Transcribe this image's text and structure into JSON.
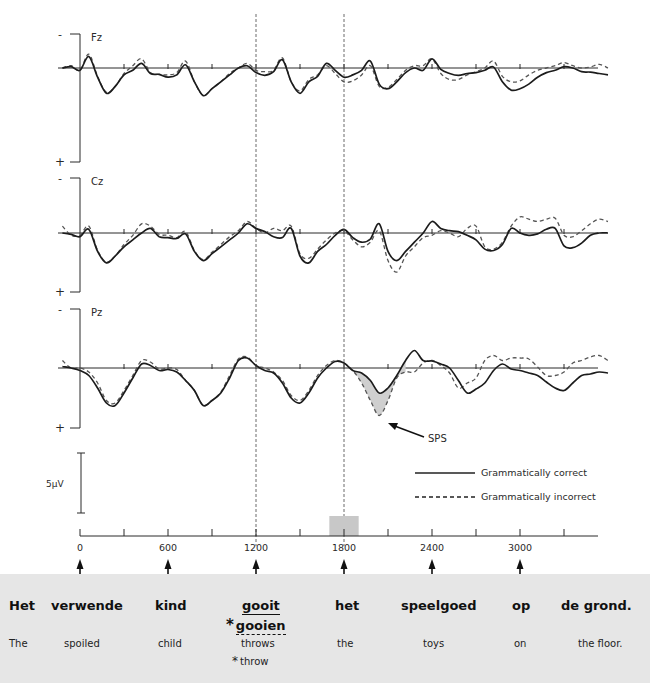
{
  "chart_data": {
    "type": "line",
    "title": "",
    "xlabel": "",
    "ylabel": "",
    "x_ticks": [
      0,
      600,
      1200,
      1800,
      2400,
      3000
    ],
    "minor_x_ticks": [
      300,
      900,
      1500,
      2100,
      2700,
      3300
    ],
    "xlim": [
      0,
      3600
    ],
    "polarity": {
      "negative_label": "-",
      "positive_label": "+",
      "negative_up": true
    },
    "scale_bar_label": "5µV",
    "vertical_markers_ms": [
      1200,
      1800
    ],
    "highlight_window_ms": [
      1700,
      1900
    ],
    "legend": [
      {
        "name": "Grammatically correct",
        "style": "solid"
      },
      {
        "name": "Grammatically incorrect",
        "style": "dashed"
      }
    ],
    "annotation": {
      "label": "SPS",
      "target_ms": 2000,
      "panel": "Pz"
    },
    "panels": [
      {
        "name": "Fz",
        "series": [
          {
            "name": "Grammatically correct",
            "x": [
              -120,
              -60,
              0,
              60,
              120,
              180,
              240,
              300,
              360,
              420,
              480,
              540,
              600,
              660,
              720,
              780,
              840,
              900,
              960,
              1020,
              1080,
              1140,
              1200,
              1260,
              1320,
              1380,
              1440,
              1500,
              1560,
              1620,
              1680,
              1740,
              1800,
              1860,
              1920,
              1980,
              2040,
              2100,
              2160,
              2220,
              2280,
              2340,
              2400,
              2460,
              2520,
              2580,
              2640,
              2700,
              2760,
              2820,
              2880,
              2940,
              3000,
              3060,
              3120,
              3180,
              3240,
              3300,
              3360,
              3420,
              3480,
              3540,
              3600
            ],
            "y": [
              0,
              -0.3,
              0.5,
              -2.5,
              2,
              5.5,
              4,
              1.5,
              0.5,
              -1,
              1.2,
              1.4,
              2,
              1.5,
              -0.7,
              3,
              6,
              4.5,
              3,
              1.5,
              0,
              -0.5,
              1,
              1.6,
              0.8,
              -1.8,
              3,
              5.5,
              3,
              1.8,
              -1,
              0.5,
              2,
              1.5,
              0.5,
              -1.5,
              3.5,
              4.5,
              3,
              1,
              0,
              0.5,
              -2,
              0.3,
              1.2,
              1.6,
              1.2,
              1,
              0.5,
              -0.2,
              3,
              4.8,
              4.5,
              3.5,
              2,
              1,
              0.5,
              -0.3,
              0,
              0.8,
              0.9,
              1.2,
              1.5
            ]
          },
          {
            "name": "Grammatically incorrect",
            "x": [
              -120,
              -60,
              0,
              60,
              120,
              180,
              240,
              300,
              360,
              420,
              480,
              540,
              600,
              660,
              720,
              780,
              840,
              900,
              960,
              1020,
              1080,
              1140,
              1200,
              1260,
              1320,
              1380,
              1440,
              1500,
              1560,
              1620,
              1680,
              1740,
              1800,
              1860,
              1920,
              1980,
              2040,
              2100,
              2160,
              2220,
              2280,
              2340,
              2400,
              2460,
              2520,
              2580,
              2640,
              2700,
              2760,
              2820,
              2880,
              2940,
              3000,
              3060,
              3120,
              3180,
              3240,
              3300,
              3360,
              3420,
              3480,
              3540,
              3600
            ],
            "y": [
              0,
              -0.5,
              0.5,
              -3,
              1.8,
              5.3,
              4,
              1.2,
              -0.5,
              -2,
              1,
              1.4,
              1.5,
              1,
              -1.5,
              3,
              6,
              4.5,
              3,
              1.2,
              0,
              -1,
              0.5,
              0.8,
              0.5,
              -2.2,
              3,
              5,
              2.5,
              1.5,
              -0.5,
              1.2,
              3,
              2.8,
              1.5,
              -0.5,
              4,
              4.2,
              2.5,
              0.5,
              -0.5,
              -0.5,
              -2,
              1.2,
              2.5,
              2.5,
              1.5,
              0.8,
              0,
              -1.5,
              1.8,
              3,
              2.8,
              1.5,
              0.5,
              0,
              -0.5,
              -1.2,
              -0.5,
              0,
              -0.2,
              -0.8,
              0
            ]
          }
        ]
      },
      {
        "name": "Cz",
        "series": [
          {
            "name": "Grammatically correct",
            "x": [
              -120,
              -60,
              0,
              60,
              120,
              180,
              240,
              300,
              360,
              420,
              480,
              540,
              600,
              660,
              720,
              780,
              840,
              900,
              960,
              1020,
              1080,
              1140,
              1200,
              1260,
              1320,
              1380,
              1440,
              1500,
              1560,
              1620,
              1680,
              1740,
              1800,
              1860,
              1920,
              1980,
              2040,
              2100,
              2160,
              2220,
              2280,
              2340,
              2400,
              2460,
              2520,
              2580,
              2640,
              2700,
              2760,
              2820,
              2880,
              2940,
              3000,
              3060,
              3120,
              3180,
              3240,
              3300,
              3360,
              3420,
              3480,
              3540,
              3600
            ],
            "y": [
              0,
              0.3,
              0.8,
              -0.8,
              4,
              6.5,
              5,
              3,
              1.5,
              0,
              -1,
              0.8,
              1,
              1.2,
              0.2,
              4,
              6,
              4.5,
              3,
              1.5,
              0,
              -2,
              -1,
              -0.3,
              0.8,
              1,
              -1,
              5,
              6.5,
              4,
              2.5,
              0.5,
              -0.8,
              1,
              2,
              1.3,
              -2,
              4,
              6,
              4,
              2,
              0,
              -2.5,
              -1,
              -0.5,
              -0.3,
              0.5,
              1.5,
              3.5,
              3.8,
              2.5,
              -1,
              0,
              0.5,
              0.2,
              -0.8,
              -1,
              2.8,
              3.2,
              2.2,
              0.5,
              0,
              0
            ]
          },
          {
            "name": "Grammatically incorrect",
            "x": [
              -120,
              -60,
              0,
              60,
              120,
              180,
              240,
              300,
              360,
              420,
              480,
              540,
              600,
              660,
              720,
              780,
              840,
              900,
              960,
              1020,
              1080,
              1140,
              1200,
              1260,
              1320,
              1380,
              1440,
              1500,
              1560,
              1620,
              1680,
              1740,
              1800,
              1860,
              1920,
              1980,
              2040,
              2100,
              2160,
              2220,
              2280,
              2340,
              2400,
              2460,
              2520,
              2580,
              2640,
              2700,
              2760,
              2820,
              2880,
              2940,
              3000,
              3060,
              3120,
              3180,
              3240,
              3300,
              3360,
              3420,
              3480,
              3540,
              3600
            ],
            "y": [
              -1.5,
              0.5,
              0.5,
              -1.5,
              3.8,
              6.3,
              5,
              2.5,
              0.5,
              -2,
              -1.5,
              0.3,
              0.5,
              1,
              -0.3,
              3.8,
              5.8,
              4.2,
              2.5,
              0.8,
              -0.5,
              -2.5,
              -1,
              0,
              -1,
              -0.5,
              -1.5,
              4.5,
              5.5,
              3.5,
              1.5,
              0,
              -0.5,
              1.5,
              3,
              2,
              -0.5,
              6,
              8.5,
              5,
              3,
              1,
              0.5,
              -0.5,
              0,
              0.8,
              -1,
              -1.5,
              3,
              3.5,
              2,
              -1.5,
              -3.5,
              -3,
              -2.5,
              -3,
              -3.2,
              0.5,
              0.8,
              -0.5,
              -2,
              -3,
              -2.5
            ]
          }
        ]
      },
      {
        "name": "Pz",
        "series": [
          {
            "name": "Grammatically correct",
            "x": [
              -120,
              -60,
              0,
              60,
              120,
              180,
              240,
              300,
              360,
              420,
              480,
              540,
              600,
              660,
              720,
              780,
              840,
              900,
              960,
              1020,
              1080,
              1140,
              1200,
              1260,
              1320,
              1380,
              1440,
              1500,
              1560,
              1620,
              1680,
              1740,
              1800,
              1860,
              1920,
              1980,
              2040,
              2100,
              2160,
              2220,
              2280,
              2340,
              2400,
              2460,
              2520,
              2580,
              2640,
              2700,
              2760,
              2820,
              2880,
              2940,
              3000,
              3060,
              3120,
              3180,
              3240,
              3300,
              3360,
              3420,
              3480,
              3540,
              3600
            ],
            "y": [
              -0.3,
              0,
              0.5,
              1.5,
              4,
              7,
              7.5,
              5,
              2,
              -0.8,
              -0.5,
              0.5,
              0.3,
              0.8,
              2.5,
              4.5,
              7.5,
              6.5,
              5,
              2,
              -1.5,
              -2,
              -0.5,
              0.5,
              1,
              3,
              6,
              7,
              5,
              2,
              0,
              -1.3,
              -1,
              0.5,
              1,
              2.5,
              5,
              4,
              1.5,
              -1.5,
              -3.5,
              -1.5,
              -1.4,
              -0.8,
              0,
              2.5,
              5,
              4.2,
              3,
              0.5,
              -0.8,
              0.2,
              0.5,
              1,
              1.5,
              2.8,
              4,
              4.5,
              3,
              1.5,
              1.2,
              0.8,
              1
            ]
          },
          {
            "name": "Grammatically incorrect",
            "x": [
              -120,
              -60,
              0,
              60,
              120,
              180,
              240,
              300,
              360,
              420,
              480,
              540,
              600,
              660,
              720,
              780,
              840,
              900,
              960,
              1020,
              1080,
              1140,
              1200,
              1260,
              1320,
              1380,
              1440,
              1500,
              1560,
              1620,
              1680,
              1740,
              1800,
              1860,
              1920,
              1980,
              2040,
              2100,
              2160,
              2220,
              2280,
              2340,
              2400,
              2460,
              2520,
              2580,
              2640,
              2700,
              2760,
              2820,
              2880,
              2940,
              3000,
              3060,
              3120,
              3180,
              3240,
              3300,
              3360,
              3420,
              3480,
              3540,
              3600
            ],
            "y": [
              -1.5,
              0,
              0,
              0.8,
              3,
              6.5,
              7,
              4.5,
              1.5,
              -1.5,
              -1.2,
              0.2,
              0,
              0.3,
              2.5,
              4.5,
              7.5,
              6.5,
              4.8,
              1.5,
              -1.8,
              -2.2,
              -0.5,
              0,
              0.8,
              2.5,
              5.5,
              6.5,
              4.5,
              1.5,
              -0.5,
              -1.5,
              -1,
              0.5,
              3,
              6.5,
              9.5,
              6.5,
              2,
              0.8,
              0.8,
              -1,
              -1.5,
              -0.5,
              1,
              4,
              3,
              2,
              -1.5,
              -2.5,
              -1.5,
              -2,
              -2,
              -1.8,
              -0.2,
              1.5,
              1.5,
              0.8,
              -1,
              -1.5,
              -2.2,
              -2.5,
              -1.5
            ]
          }
        ]
      }
    ]
  },
  "sentence": {
    "words": [
      {
        "text": "Het",
        "gloss": "The"
      },
      {
        "text": "verwende",
        "gloss": "spoiled"
      },
      {
        "text": "kind",
        "gloss": "child"
      },
      {
        "text": "gooit",
        "gloss": "throws",
        "alt_text": "gooien",
        "alt_gloss": "throw",
        "alt_marker": "*"
      },
      {
        "text": "het",
        "gloss": "the"
      },
      {
        "text": "speelgoed",
        "gloss": "toys"
      },
      {
        "text": "op",
        "gloss": "on"
      },
      {
        "text": "de grond.",
        "gloss": "the floor."
      }
    ]
  }
}
